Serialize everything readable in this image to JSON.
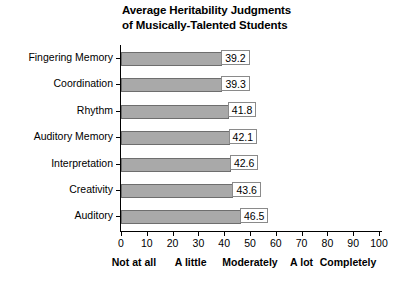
{
  "chart_data": {
    "type": "bar",
    "orientation": "horizontal",
    "title": "Average Heritability Judgments of Musically-Talented Students",
    "title_lines": [
      "Average Heritability Judgments",
      "of Musically-Talented Students"
    ],
    "xlabel": "",
    "ylabel": "",
    "categories": [
      "Fingering Memory",
      "Coordination",
      "Rhythm",
      "Auditory Memory",
      "Interpretation",
      "Creativity",
      "Auditory"
    ],
    "values": [
      39.2,
      39.3,
      41.8,
      42.1,
      42.6,
      43.6,
      46.5
    ],
    "value_labels": [
      "39.2",
      "39.3",
      "41.8",
      "42.1",
      "42.6",
      "43.6",
      "46.5"
    ],
    "xlim": [
      0,
      100
    ],
    "xticks": [
      0,
      10,
      20,
      30,
      40,
      50,
      60,
      70,
      80,
      90,
      100
    ],
    "xtick_labels": [
      "0",
      "10",
      "20",
      "30",
      "40",
      "50",
      "60",
      "70",
      "80",
      "90",
      "100"
    ],
    "grid": false,
    "legend": null,
    "scale_anchors": [
      {
        "label": "Not at all",
        "value": 5
      },
      {
        "label": "A little",
        "value": 27
      },
      {
        "label": "Moderately",
        "value": 50
      },
      {
        "label": "A lot",
        "value": 70
      },
      {
        "label": "Completely",
        "value": 88
      }
    ],
    "colors": {
      "bar_fill": "#a9a9a9",
      "bar_border": "#6e6e6e",
      "axis": "#000000",
      "label_box_border": "#8a8a8a",
      "label_box_fill": "#ffffff",
      "background": "#ffffff",
      "text": "#000000"
    }
  }
}
